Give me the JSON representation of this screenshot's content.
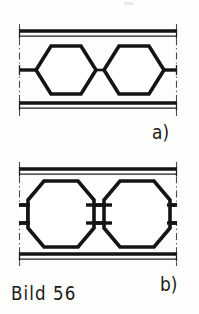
{
  "document": {
    "caption": "Bild 56",
    "background_color": "#fdfdfc",
    "ink_color": "#1a1a1a",
    "width": 199,
    "height": 314
  },
  "labels": {
    "part_a": "a)",
    "part_b": "b)"
  },
  "figures": [
    {
      "id": "figure-a",
      "label": "a)",
      "description": "Two hexagons joined by a single thin link, enclosed between upper and lower double guide rails, delimited left and right by dash-dot centre lines",
      "link_type": "single-line",
      "element_shape": "hexagon",
      "element_count": 2,
      "rail_lines": {
        "upper": [
          "thick",
          "thin"
        ],
        "lower": [
          "thick",
          "thin"
        ]
      },
      "boundary_lines": "dash-dot"
    },
    {
      "id": "figure-b",
      "label": "b)",
      "description": "Two octagons joined by a rectangular double-line link, enclosed between upper and lower double guide rails, delimited left and right by dash-dot centre lines",
      "link_type": "rectangular-double-line",
      "element_shape": "octagon",
      "element_count": 2,
      "rail_lines": {
        "upper": [
          "thick",
          "thin"
        ],
        "lower": [
          "thick",
          "thin"
        ]
      },
      "boundary_lines": "dash-dot"
    }
  ],
  "geometry": {
    "figure_a": {
      "left_bound_x": 19,
      "right_bound_x": 176,
      "rail_top_y": 31,
      "rail_top_thin_y": 36,
      "rail_bottom_y": 103,
      "rail_bottom_thin_y": 108,
      "axis_y": 70,
      "hex_left_center_x": 64,
      "hex_right_center_x": 132,
      "hex_half_width": 30,
      "hex_half_height": 25,
      "hex_flat_half": 15,
      "stub_left_x": 19,
      "stub_right_x": 176
    },
    "figure_b": {
      "left_bound_x": 19,
      "right_bound_x": 176,
      "rail_top_y": 169,
      "rail_top_thin_y": 174,
      "rail_bottom_y": 254,
      "rail_bottom_thin_y": 259,
      "axis_y": 214,
      "oct_left_center_x": 61,
      "oct_right_center_x": 136,
      "oct_half_width": 33,
      "oct_half_height": 33,
      "oct_flat_half_x": 17,
      "oct_flat_half_y": 14,
      "link_half_width": 18,
      "link_half_height": 9
    }
  }
}
